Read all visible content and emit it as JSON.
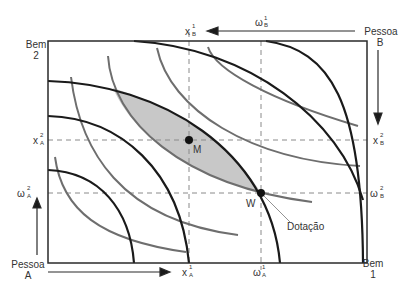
{
  "colors": {
    "box": "#2a2a2a",
    "curve_black": "#1a1a1a",
    "curve_gray": "#6e6e6e",
    "shade": "#c8c8c8",
    "dash": "#8a8a8a",
    "text": "#333333"
  },
  "labels": {
    "bem2": "Bem",
    "bem2_num": "2",
    "bem1": "Bem",
    "bem1_num": "1",
    "pessoa_a": "Pessoa",
    "pessoa_a_letter": "A",
    "pessoa_b": "Pessoa",
    "pessoa_b_letter": "B",
    "xB1_base": "x",
    "xB1_sup": "1",
    "xB1_sub": "B",
    "omegaB1_base": "ω",
    "omegaB1_sup": "1",
    "omegaB1_sub": "B",
    "xA2_base": "x",
    "xA2_sup": "2",
    "xA2_sub": "A",
    "omegaA2_base": "ω",
    "omegaA2_sup": "2",
    "omegaA2_sub": "A",
    "xB2_base": "x",
    "xB2_sup": "2",
    "xB2_sub": "B",
    "omegaB2_base": "ω",
    "omegaB2_sup": "2",
    "omegaB2_sub": "B",
    "xA1_base": "x",
    "xA1_sup": "1",
    "xA1_sub": "A",
    "omegaA1_base": "ω",
    "omegaA1_sup": "1",
    "omegaA1_sub": "A",
    "point_m": "M",
    "point_w": "W",
    "dotacao": "Dotação"
  }
}
